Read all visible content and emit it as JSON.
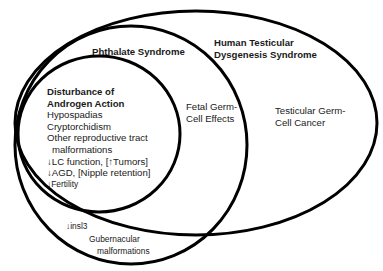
{
  "diagram": {
    "type": "nested-venn",
    "stroke_color": "#000000",
    "background_color": "#ffffff",
    "sets": {
      "human_tds": {
        "title_line1": "Human Testicular",
        "title_line2": "Dysgenesis Syndrome",
        "items": {
          "tgcc_line1": "Testicular Germ-",
          "tgcc_line2": "Cell Cancer"
        }
      },
      "phthalate": {
        "title": "Phthalate Syndrome",
        "items": {
          "fetal_line1": "Fetal Germ-",
          "fetal_line2": "Cell Effects"
        },
        "outside_overlap_items": {
          "insl3": "↓insl3",
          "gub_line1": "Gubernacular",
          "gub_line2": "malformations"
        }
      },
      "androgen": {
        "title_line1": "Disturbance of",
        "title_line2": "Androgen Action",
        "items": [
          "Hypospadias",
          "Cryptorchidism",
          "Other reproductive tract",
          "malformations",
          "↓LC function, [↑Tumors]",
          "↓AGD, [Nipple retention]",
          "↓Fertility"
        ]
      }
    }
  }
}
